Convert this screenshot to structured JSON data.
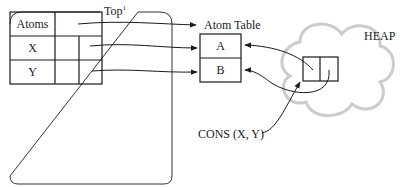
{
  "diagram": {
    "symbol_table": {
      "header_label": "Atoms",
      "rows": [
        {
          "label": "X"
        },
        {
          "label": "Y"
        }
      ],
      "top_label": "Top",
      "top_superscript": "1"
    },
    "atom_table": {
      "title": "Atom Table",
      "entries": [
        "A",
        "B"
      ]
    },
    "heap": {
      "label": "HEAP",
      "cloud_color": "#cccccc"
    },
    "cons_label": "CONS (X, Y)"
  }
}
